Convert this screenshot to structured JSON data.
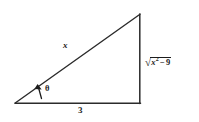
{
  "figure": {
    "kind": "right-triangle-diagram",
    "background_color": "#ffffff",
    "stroke_color": "#2b2b2b",
    "labels": {
      "hypotenuse": "x",
      "base": "3",
      "angle": "θ",
      "opposite_radical": "√",
      "opposite_radicand_var": "x",
      "opposite_radicand_exponent": "2",
      "opposite_minus": "−",
      "opposite_constant": "9",
      "opposite_full": "√(x² − 9)"
    },
    "geometry": {
      "left_vertex": "15,103",
      "bottom_right_vertex": "140,103",
      "top_right_vertex": "140,14",
      "angle_position": "left_vertex",
      "right_angle_position": "bottom_right_vertex"
    }
  }
}
